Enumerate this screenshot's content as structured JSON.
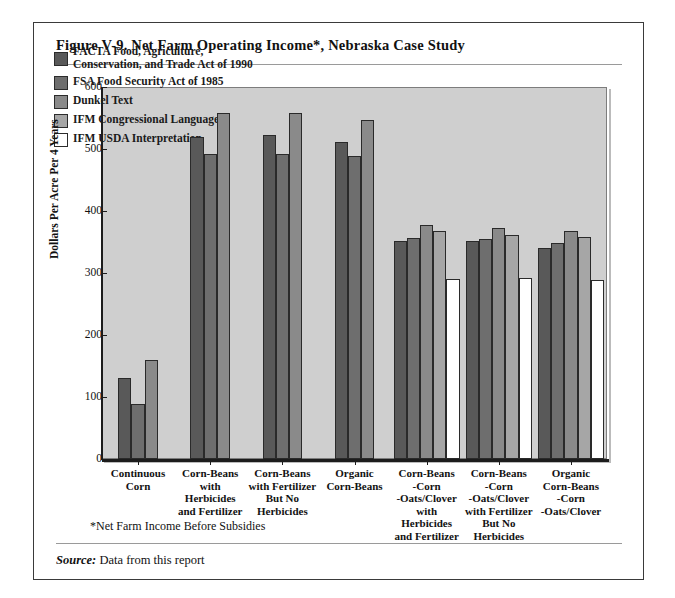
{
  "figure": {
    "title": "Figure V-9.  Net Farm Operating Income*, Nebraska Case Study",
    "footnote": "*Net Farm Income Before Subsidies",
    "source_label": "Source:",
    "source_text": " Data from this report"
  },
  "chart_data": {
    "type": "bar",
    "title": "Net Farm Operating Income*, Nebraska Case Study",
    "xlabel": "",
    "ylabel": "Dollars Per Acre Per 4 Years",
    "ylim": [
      0,
      600
    ],
    "yticks": [
      0,
      100,
      200,
      300,
      400,
      500,
      600
    ],
    "ytick_labels": [
      "0",
      "100",
      "200",
      "300",
      "400",
      "500",
      "600"
    ],
    "grid": false,
    "legend_position": "upper-left-inside",
    "plot_background": "#cfcfcf",
    "categories": [
      "Continuous\nCorn",
      "Corn-Beans\nwith\nHerbicides\nand Fertilizer",
      "Corn-Beans\nwith Fertilizer\nBut No\nHerbicides",
      "Organic\nCorn-Beans",
      "Corn-Beans\n-Corn\n-Oats/Clover\nwith\nHerbicides\nand Fertilizer",
      "Corn-Beans\n-Corn\n-Oats/Clover\nwith Fertilizer\nBut No\nHerbicides",
      "Organic\nCorn-Beans\n-Corn\n-Oats/Clover"
    ],
    "series": [
      {
        "name": "FACTA  Food, Agriculture,\nConservation, and Trade Act of 1990",
        "short_name": "FACTA",
        "color": "#595959",
        "values": [
          130,
          520,
          522,
          512,
          352,
          351,
          340
        ]
      },
      {
        "name": "FSA  Food Security Act of 1985",
        "short_name": "FSA",
        "color": "#6e6e6e",
        "values": [
          88,
          492,
          492,
          488,
          357,
          355,
          348
        ]
      },
      {
        "name": "Dunkel Text",
        "short_name": "Dunkel",
        "color": "#8a8a8a",
        "values": [
          160,
          558,
          558,
          546,
          378,
          372,
          368
        ]
      },
      {
        "name": "IFM  Congressional Language",
        "short_name": "IFM-CL",
        "color": "#a6a6a6",
        "values": [
          null,
          null,
          null,
          null,
          368,
          362,
          358
        ]
      },
      {
        "name": "IFM  USDA Interpretation",
        "short_name": "IFM-USDA",
        "color": "#ffffff",
        "values": [
          null,
          null,
          null,
          null,
          290,
          292,
          288
        ]
      }
    ]
  },
  "legend": {
    "items": [
      {
        "label": "FACTA  Food, Agriculture,\nConservation, and Trade Act of 1990",
        "color": "#595959"
      },
      {
        "label": "FSA  Food Security Act of 1985",
        "color": "#6e6e6e"
      },
      {
        "label": "Dunkel Text",
        "color": "#8a8a8a"
      },
      {
        "label": "IFM  Congressional Language",
        "color": "#a6a6a6"
      },
      {
        "label": "IFM  USDA Interpretation",
        "color": "#ffffff"
      }
    ]
  }
}
